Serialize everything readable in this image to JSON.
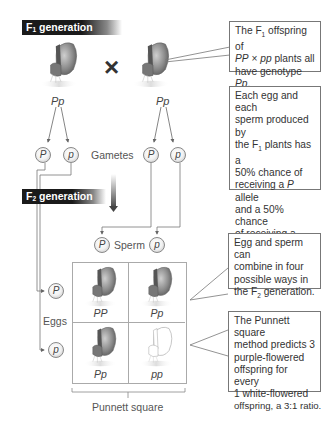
{
  "f1": {
    "banner": {
      "letter": "F",
      "sub": "1",
      "text": " generation"
    },
    "left_plant_genotype": "Pp",
    "right_plant_genotype": "Pp",
    "cross_symbol": "×"
  },
  "gametes": {
    "label": "Gametes",
    "left": [
      "P",
      "p"
    ],
    "right": [
      "P",
      "p"
    ]
  },
  "f2": {
    "banner": {
      "letter": "F",
      "sub": "2",
      "text": " generation"
    },
    "sperm_label": "Sperm",
    "sperm": [
      "P",
      "p"
    ],
    "eggs_label": "Eggs",
    "eggs": [
      "P",
      "p"
    ]
  },
  "punnett": {
    "label": "Punnett square",
    "cells": [
      {
        "genotype": "PP",
        "flower": "purple"
      },
      {
        "genotype": "Pp",
        "flower": "purple"
      },
      {
        "genotype": "Pp",
        "flower": "purple"
      },
      {
        "genotype": "pp",
        "flower": "white"
      }
    ]
  },
  "callouts": {
    "c1": {
      "l1a": "The F",
      "l1sub": "1",
      "l1b": " offspring of",
      "l2a": "PP",
      "l2b": " × ",
      "l2c": "pp",
      "l2d": " plants all",
      "l3a": "have genotype ",
      "l3b": "Pp",
      "l3c": "."
    },
    "c2": {
      "l1": "Each egg and each",
      "l2": "sperm produced by",
      "l3a": "the F",
      "l3sub": "1",
      "l3b": " plants has a",
      "l4": "50% chance of",
      "l5a": "receiving a ",
      "l5b": "P",
      "l5c": " allele",
      "l6": "and a 50% chance",
      "l7": "of receiving a",
      "l8a": "p",
      "l8b": " allele."
    },
    "c3": {
      "l1": "Egg and sperm can",
      "l2": "combine in four",
      "l3": "possible ways in",
      "l4a": "the F",
      "l4sub": "2",
      "l4b": " generation."
    },
    "c4": {
      "l1": "The Punnett square",
      "l2": "method predicts 3",
      "l3": "purple-flowered",
      "l4": "offspring for every",
      "l5": "1 white-flowered",
      "l6": "offspring, a 3:1 ratio."
    }
  },
  "colors": {
    "banner": "#1a1a1a",
    "line": "#777777",
    "purple_flower": "#6e6e6e",
    "white_flower": "#ffffff"
  }
}
